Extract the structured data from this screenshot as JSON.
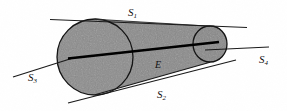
{
  "figure": {
    "background_color": "#ffffff",
    "body_fill": "#8a8a8a",
    "outline_color": "#111111",
    "axis_color": "#000000",
    "labels": {
      "s1": {
        "base": "S",
        "sub": "1"
      },
      "s2": {
        "base": "S",
        "sub": "2"
      },
      "s3": {
        "base": "S",
        "sub": "3"
      },
      "s4": {
        "base": "S",
        "sub": "4"
      },
      "axis": {
        "base": "E",
        "sub": ""
      }
    },
    "geometry": {
      "left_face": {
        "cx": 95,
        "cy": 57,
        "r": 38
      },
      "right_face": {
        "cx": 210,
        "cy": 44,
        "rx": 17,
        "ry": 18
      },
      "axis_line": {
        "x1": 68,
        "y1": 58,
        "x2": 219,
        "y2": 42
      },
      "tangent_s1": {
        "x1": 50,
        "y1": 20,
        "x2": 247,
        "y2": 28
      },
      "tangent_s2": {
        "x1": 68,
        "y1": 103,
        "x2": 235,
        "y2": 60
      },
      "tangent_s3": {
        "x1": 14,
        "y1": 76,
        "x2": 72,
        "y2": 59
      },
      "tangent_s4": {
        "x1": 206,
        "y1": 50,
        "x2": 268,
        "y2": 48
      }
    }
  }
}
